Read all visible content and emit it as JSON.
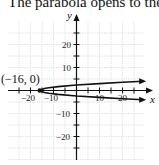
{
  "caption": "The parabola opens to the righ",
  "chart_data": {
    "type": "line",
    "xlabel": "x",
    "ylabel": "y",
    "xlim": [
      -30,
      30
    ],
    "ylim": [
      -30,
      30
    ],
    "grid": true,
    "grid_step": 5,
    "x_ticks": [
      -20,
      -10,
      10,
      20
    ],
    "y_ticks": [
      20,
      10,
      -10,
      -20
    ],
    "series": [
      {
        "name": "parabola",
        "equation_approx": "x = 2.8y^2 - 16",
        "vertex": [
          -16,
          0
        ],
        "points": [
          [
            29,
            -4
          ],
          [
            20,
            -3.6
          ],
          [
            10,
            -3
          ],
          [
            0,
            -2.4
          ],
          [
            -8,
            -1.7
          ],
          [
            -12,
            -1.2
          ],
          [
            -14,
            -0.85
          ],
          [
            -16,
            0
          ],
          [
            -14,
            0.85
          ],
          [
            -12,
            1.2
          ],
          [
            -8,
            1.7
          ],
          [
            0,
            2.4
          ],
          [
            10,
            3
          ],
          [
            20,
            3.6
          ],
          [
            29,
            4
          ]
        ],
        "color": "#111111"
      }
    ],
    "annotations": [
      {
        "text": "(−16, 0)",
        "x": -16,
        "y": 0
      }
    ]
  },
  "labels": {
    "x_axis": "x",
    "y_axis": "y",
    "vertex": "(−16, 0)",
    "ticks": {
      "xm20": "−20",
      "xm10": "−10",
      "x10": "10",
      "x20": "20",
      "y20": "20",
      "y10": "10",
      "ym10": "−10",
      "ym20": "−20"
    }
  }
}
